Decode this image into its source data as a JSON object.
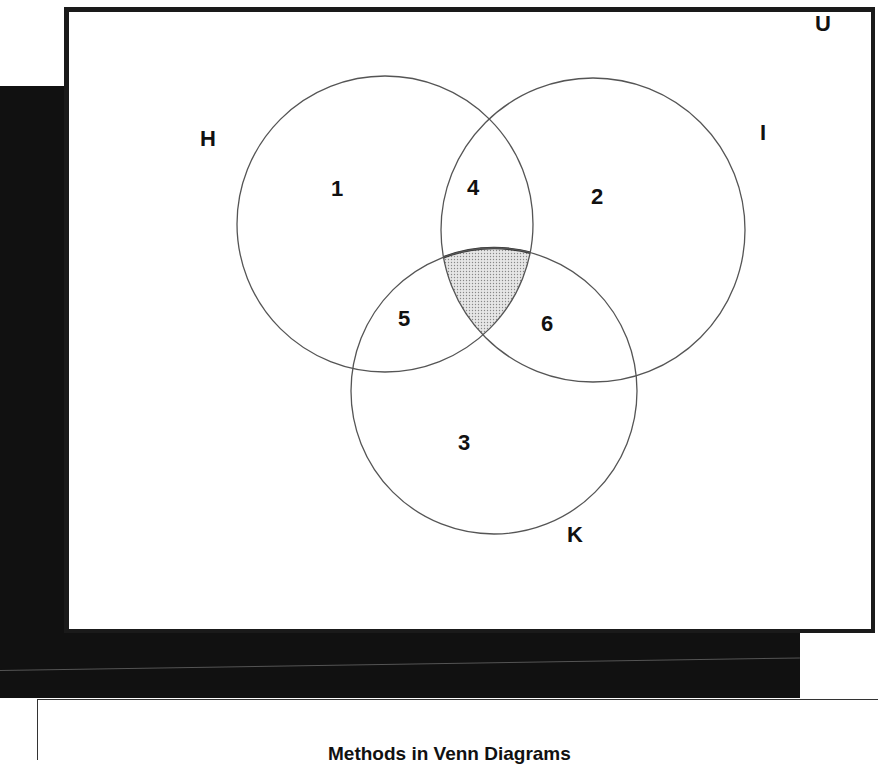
{
  "diagram": {
    "type": "venn",
    "universe_label": "U",
    "sets": [
      {
        "name": "H",
        "label": "H",
        "cx": 385,
        "cy": 224,
        "r": 148,
        "label_x": 200,
        "label_y": 146
      },
      {
        "name": "I",
        "label": "I",
        "cx": 593,
        "cy": 230,
        "r": 152,
        "label_x": 760,
        "label_y": 140
      },
      {
        "name": "K",
        "label": "K",
        "cx": 494,
        "cy": 391,
        "r": 143,
        "label_x": 567,
        "label_y": 542
      }
    ],
    "regions": [
      {
        "id": "1",
        "label": "1",
        "x": 331,
        "y": 196
      },
      {
        "id": "2",
        "label": "2",
        "x": 591,
        "y": 204
      },
      {
        "id": "3",
        "label": "3",
        "x": 458,
        "y": 450
      },
      {
        "id": "4",
        "label": "4",
        "x": 467,
        "y": 195
      },
      {
        "id": "5",
        "label": "5",
        "x": 398,
        "y": 326
      },
      {
        "id": "6",
        "label": "6",
        "x": 541,
        "y": 331
      }
    ],
    "shaded_region": "H ∩ I ∩ K",
    "colors": {
      "frame": "#1a1a1a",
      "circle_stroke": "#555555",
      "shade": "#bdbdbd",
      "background_band": "#111111"
    }
  },
  "caption": {
    "text": "Methods in Venn Diagrams"
  }
}
